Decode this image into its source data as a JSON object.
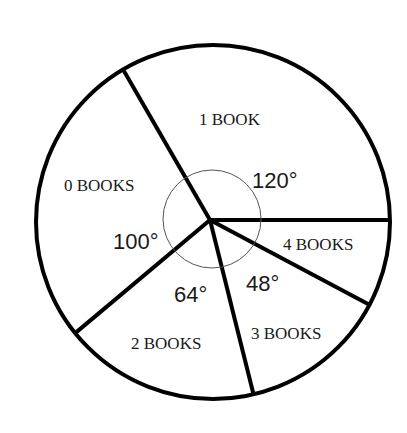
{
  "chart_data": {
    "type": "pie",
    "title": "",
    "unit": "degrees",
    "categories": [
      "1 BOOK",
      "0 BOOKS",
      "2 BOOKS",
      "3 BOOKS",
      "4 BOOKS"
    ],
    "values": [
      120,
      100,
      64,
      48,
      28
    ],
    "angle_labels": [
      "120°",
      "100°",
      "64°",
      "48°",
      ""
    ],
    "start_angle_deg": 0,
    "direction": "counterclockwise",
    "legend": "none"
  },
  "geometry": {
    "center": [
      210,
      220
    ],
    "outer_center": [
      213,
      222
    ],
    "radius": 177,
    "inner_circle_radius": 49
  },
  "labels": {
    "slices": [
      {
        "text": "1 BOOK",
        "x": 199,
        "y": 125
      },
      {
        "text": "0 BOOKS",
        "x": 64,
        "y": 191
      },
      {
        "text": "2 BOOKS",
        "x": 131,
        "y": 349
      },
      {
        "text": "3 BOOKS",
        "x": 251,
        "y": 339
      },
      {
        "text": "4 BOOKS",
        "x": 283,
        "y": 250
      }
    ],
    "angles": [
      {
        "text": "120°",
        "x": 252,
        "y": 188
      },
      {
        "text": "100°",
        "x": 113,
        "y": 249
      },
      {
        "text": "64°",
        "x": 174,
        "y": 302
      },
      {
        "text": "48°",
        "x": 246,
        "y": 291
      }
    ]
  },
  "colors": {
    "stroke": "#000000",
    "fill": "#ffffff",
    "inner_circle": "#555555",
    "text": "#1a1a1a"
  }
}
